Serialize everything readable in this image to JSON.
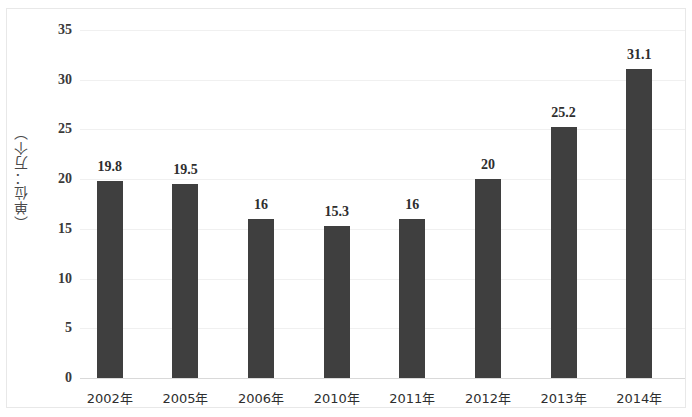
{
  "chart_data": {
    "type": "bar",
    "title": "",
    "subtitle": "",
    "xlabel": "",
    "ylabel": "（单位：万个）",
    "categories": [
      "2002年",
      "2005年",
      "2006年",
      "2010年",
      "2011年",
      "2012年",
      "2013年",
      "2014年"
    ],
    "values": [
      19.8,
      19.5,
      16,
      15.3,
      16,
      20,
      25.2,
      31.1
    ],
    "value_labels": [
      "19.8",
      "19.5",
      "16",
      "15.3",
      "16",
      "20",
      "25.2",
      "31.1"
    ],
    "ylim": [
      0,
      35
    ],
    "yticks": [
      0,
      5,
      10,
      15,
      20,
      25,
      30,
      35
    ],
    "ytick_labels": [
      "0",
      "5",
      "10",
      "15",
      "20",
      "25",
      "30",
      "35"
    ],
    "grid": true,
    "legend": false,
    "legend_position": "none",
    "bar_color": "#3f3f3f",
    "gridline_color": "#f0f0f0",
    "axis_color": "#d9d9d9",
    "frame_color": "#e8e8e8",
    "background_color": "#ffffff",
    "label_color": "#2e2e2e"
  }
}
